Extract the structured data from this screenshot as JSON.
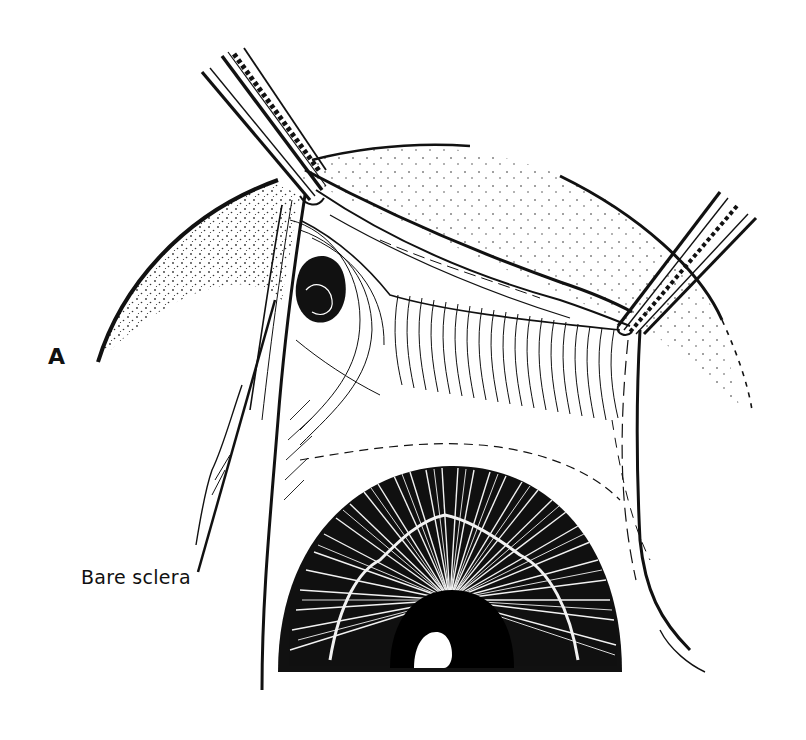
{
  "figure": {
    "panel_label": "A",
    "callouts": [
      {
        "text": "Bare sclera"
      }
    ],
    "colors": {
      "ink": "#111111",
      "paper": "#ffffff"
    }
  }
}
